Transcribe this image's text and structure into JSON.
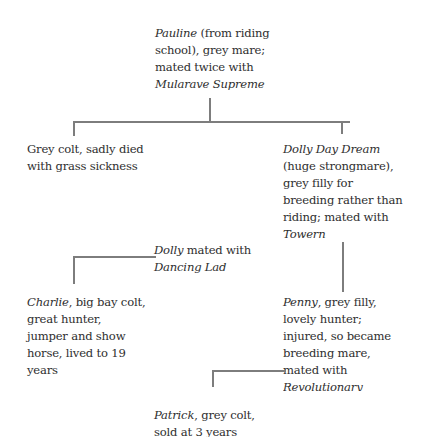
{
  "diagram": {
    "type": "family-tree",
    "nodes": {
      "pauline": {
        "name": "Pauline",
        "desc_line1": " (from riding",
        "line2": "school), grey mare;",
        "line3": "mated twice with",
        "sire": "Mularave Supreme"
      },
      "grey_colt": {
        "line1": "Grey colt, sadly died",
        "line2": "with grass sickness"
      },
      "dolly_day_dream": {
        "name": "Dolly Day Dream",
        "line2": "(huge strongmare),",
        "line3": "grey filly for",
        "line4": "breeding rather than",
        "line5": "riding; mated with",
        "sire": "Towern"
      },
      "dolly_mating": {
        "name": "Dolly",
        "rest": " mated with",
        "sire": "Dancing Lad"
      },
      "charlie": {
        "name": "Charlie",
        "rest1": ", big bay colt,",
        "line2": "great hunter,",
        "line3": "jumper and show",
        "line4": "horse, lived to 19",
        "line5": "years"
      },
      "penny": {
        "name": "Penny",
        "rest1": ", grey filly,",
        "line2": "lovely hunter;",
        "line3": "injured, so became",
        "line4": "breeding mare,",
        "line5": "mated with",
        "sire": "Revolutionary"
      },
      "patrick": {
        "name": "Patrick",
        "rest1": ", grey colt,",
        "line2": "sold at 3 years"
      }
    },
    "edges": [
      {
        "from": "pauline",
        "to": "grey_colt"
      },
      {
        "from": "pauline",
        "to": "dolly_day_dream"
      },
      {
        "from": "dolly_day_dream",
        "to": "penny"
      },
      {
        "from": "dolly_mating",
        "to": "charlie"
      },
      {
        "from": "penny",
        "to": "patrick"
      }
    ],
    "colors": {
      "text": "#2e2e2e",
      "lines": "#7d7d7d",
      "background": "#ffffff"
    }
  }
}
